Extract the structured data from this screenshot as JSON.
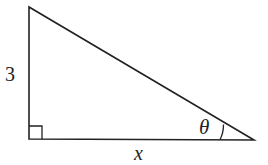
{
  "diagram": {
    "type": "right-triangle",
    "vertices": {
      "top": [
        29,
        7
      ],
      "right_angle": [
        29,
        139
      ],
      "acute": [
        254,
        140
      ]
    },
    "labels": {
      "vertical_side": "3",
      "horizontal_side": "x",
      "angle": "θ"
    },
    "right_angle_marker": true,
    "angle_arc_at": "acute",
    "stroke_color": "#222222",
    "background_color": "#ffffff"
  }
}
